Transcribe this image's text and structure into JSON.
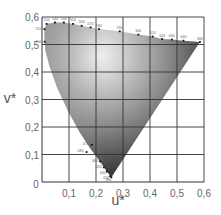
{
  "chart_data": {
    "type": "scatter",
    "title": "",
    "subtitle": "CIE 1976 u*v* chromaticity diagram (spectral locus)",
    "xlabel": "u*",
    "ylabel": "v*",
    "xlim": [
      0,
      0.6
    ],
    "ylim": [
      0,
      0.6
    ],
    "grid": true,
    "legend": null,
    "x_ticks": [
      "0",
      "0,1",
      "0,2",
      "0,3",
      "0,4",
      "0,5",
      "0,6"
    ],
    "y_ticks": [
      "0",
      "0,1",
      "0,2",
      "0,3",
      "0,4",
      "0,5",
      "0,6"
    ],
    "series": [
      {
        "name": "spectral locus",
        "points": [
          {
            "label": "380",
            "u": 0.257,
            "v": 0.017
          },
          {
            "label": "420",
            "u": 0.252,
            "v": 0.021
          },
          {
            "label": "440",
            "u": 0.24,
            "v": 0.038
          },
          {
            "label": "450",
            "u": 0.229,
            "v": 0.053
          },
          {
            "label": "460",
            "u": 0.215,
            "v": 0.075
          },
          {
            "label": "470",
            "u": 0.184,
            "v": 0.135
          },
          {
            "label": "480",
            "u": 0.165,
            "v": 0.109
          },
          {
            "label": "500",
            "u": 0.01,
            "v": 0.51
          },
          {
            "label": "510",
            "u": 0.009,
            "v": 0.556
          },
          {
            "label": "520",
            "u": 0.017,
            "v": 0.575
          },
          {
            "label": "530",
            "u": 0.048,
            "v": 0.58
          },
          {
            "label": "540",
            "u": 0.081,
            "v": 0.58
          },
          {
            "label": "550",
            "u": 0.115,
            "v": 0.575
          },
          {
            "label": "560",
            "u": 0.147,
            "v": 0.568
          },
          {
            "label": "570",
            "u": 0.18,
            "v": 0.562
          },
          {
            "label": "580",
            "u": 0.211,
            "v": 0.556
          },
          {
            "label": "590",
            "u": 0.288,
            "v": 0.548
          },
          {
            "label": "600",
            "u": 0.357,
            "v": 0.536
          },
          {
            "label": "610",
            "u": 0.41,
            "v": 0.529
          },
          {
            "label": "620",
            "u": 0.445,
            "v": 0.52
          },
          {
            "label": "630",
            "u": 0.481,
            "v": 0.518
          },
          {
            "label": "640",
            "u": 0.524,
            "v": 0.514
          },
          {
            "label": "680",
            "u": 0.585,
            "v": 0.509
          }
        ]
      }
    ],
    "annotations": [
      "wavelength labels in nm along spectral locus"
    ]
  }
}
